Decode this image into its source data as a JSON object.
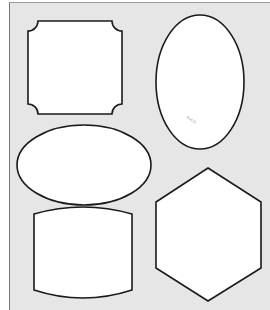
{
  "colors": {
    "background": "#e6e6e6",
    "fill": "#ffffff",
    "stroke": "#1a1a1a"
  },
  "shapes": [
    {
      "name": "notched-square",
      "label": "Notched square"
    },
    {
      "name": "vertical-oval",
      "label": "Vertical oval",
      "mark": "Aos.D"
    },
    {
      "name": "horizontal-ellipse",
      "label": "Horizontal ellipse"
    },
    {
      "name": "curved-panel",
      "label": "Curved panel"
    },
    {
      "name": "hexagon",
      "label": "Hexagon"
    }
  ]
}
